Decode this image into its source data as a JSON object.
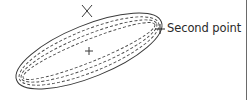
{
  "diagram": {
    "type": "ellipse-construction",
    "colors": {
      "stroke": "#3a3a3a",
      "dashed": "#4a4a4a",
      "text": "#2a2a2a",
      "background": "#ffffff"
    },
    "ellipse": {
      "center": [
        89,
        51
      ],
      "rotation_deg": -22,
      "outer": {
        "rx": 78,
        "ry": 26,
        "style": "solid"
      },
      "inner_dashed": [
        {
          "rx": 75,
          "ry": 21
        },
        {
          "rx": 73,
          "ry": 16
        },
        {
          "rx": 71,
          "ry": 11
        }
      ]
    },
    "markers": {
      "center_cross": {
        "x": 89,
        "y": 51,
        "shape": "plus"
      },
      "first_point": {
        "x": 87,
        "y": 11,
        "shape": "x-cross"
      },
      "second_point": {
        "x": 160,
        "y": 29,
        "shape": "plus"
      }
    },
    "labels": {
      "second_point": "Second point"
    }
  }
}
